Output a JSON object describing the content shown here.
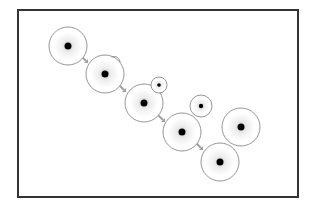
{
  "diagram": {
    "title": "",
    "frame": {
      "x": 18,
      "y": 10,
      "width": 280,
      "height": 187,
      "stroke": "#333333",
      "stroke_width": 2
    },
    "colors": {
      "circle_stroke": "#8a8a8a",
      "dot": "#000000",
      "arrow": "#a0a0a0",
      "glow_inner": "#e6e6e6",
      "background": "#ffffff"
    },
    "nodes": [
      {
        "id": "n1",
        "cx": 68,
        "cy": 46,
        "r": 19,
        "dot_r": 3.5,
        "kind": "large"
      },
      {
        "id": "n2",
        "cx": 105,
        "cy": 74,
        "r": 19,
        "dot_r": 3.5,
        "kind": "large",
        "bump": true
      },
      {
        "id": "n3",
        "cx": 144,
        "cy": 103,
        "r": 19,
        "dot_r": 3.5,
        "kind": "large"
      },
      {
        "id": "n3s",
        "cx": 159,
        "cy": 85,
        "r": 8,
        "dot_r": 1.8,
        "kind": "small"
      },
      {
        "id": "n4",
        "cx": 182,
        "cy": 132,
        "r": 19,
        "dot_r": 3.5,
        "kind": "large"
      },
      {
        "id": "n5s",
        "cx": 201,
        "cy": 106,
        "r": 11,
        "dot_r": 2.2,
        "kind": "small"
      },
      {
        "id": "n5",
        "cx": 241,
        "cy": 127,
        "r": 19,
        "dot_r": 3.5,
        "kind": "large"
      },
      {
        "id": "n6",
        "cx": 220,
        "cy": 162,
        "r": 19,
        "dot_r": 3.5,
        "kind": "large"
      }
    ],
    "edges": [
      {
        "from": "n1",
        "to": "n2",
        "x": 84,
        "y": 59
      },
      {
        "from": "n2",
        "to": "n3",
        "x": 122,
        "y": 88
      },
      {
        "from": "n3",
        "to": "n4",
        "x": 161,
        "y": 118
      },
      {
        "from": "n4",
        "to": "n6",
        "x": 199,
        "y": 146
      }
    ]
  }
}
